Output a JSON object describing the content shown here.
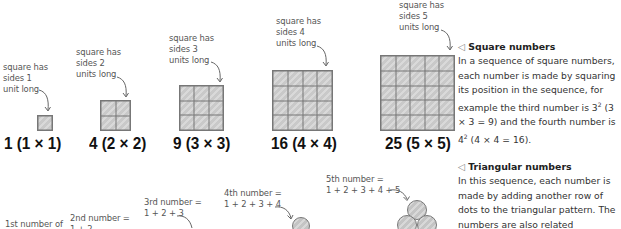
{
  "square_numbers": {
    "items": [
      {
        "annotation": "square has\nsides 1\nunit long",
        "side": 1,
        "label": "1 (1 × 1)"
      },
      {
        "annotation": "square has\nsides 2\nunits long",
        "side": 2,
        "label": "4 (2 × 2)"
      },
      {
        "annotation": "square has\nsides 3\nunits long",
        "side": 3,
        "label": "9 (3 × 3)"
      },
      {
        "annotation": "square has\nsides 4\nunits long",
        "side": 4,
        "label": "16 (4 × 4)"
      },
      {
        "annotation": "square has\nsides 5\nunits long",
        "side": 5,
        "label": "25 (5 × 5)"
      }
    ],
    "caption": {
      "icon": "triangle-left-icon",
      "heading": "Square numbers",
      "body_1": "In a sequence of square numbers, each number is made by squaring its position in the sequence, for example the third number is 3",
      "sup_1": "2",
      "body_2": " (3 × 3 = 9) and the fourth number is 4",
      "sup_2": "2",
      "body_3": " (4 × 4 = 16)."
    }
  },
  "triangular_numbers": {
    "items": [
      {
        "annotation": "1st number of"
      },
      {
        "annotation": "2nd number =\n1 + 2"
      },
      {
        "annotation": "3rd number =\n1 + 2 + 3"
      },
      {
        "annotation": "4th number =\n1 + 2 + 3 + 4"
      },
      {
        "annotation": "5th number =\n1 + 2 + 3 + 4 + 5"
      }
    ],
    "caption": {
      "icon": "triangle-left-icon",
      "heading": "Triangular numbers",
      "body": "In this sequence, each number is made by adding another row of dots to the triangular pattern. The numbers are also related"
    }
  },
  "colors": {
    "tile_fill": "#cccccc",
    "tile_border": "#777777",
    "label_text": "#111111",
    "annotation_text": "#555555"
  }
}
